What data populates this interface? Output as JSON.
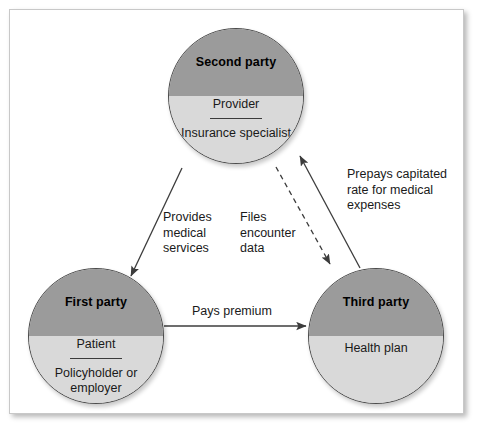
{
  "figure": {
    "type": "cycle-diagram"
  },
  "nodes": [
    {
      "id": "second-party",
      "title": "Second party",
      "role": "Provider",
      "sub": "Insurance\nspecialist",
      "position": "top-center"
    },
    {
      "id": "first-party",
      "title": "First party",
      "role": "Patient",
      "sub": "Policyholder\nor employer",
      "position": "bottom-left"
    },
    {
      "id": "third-party",
      "title": "Third party",
      "role": "",
      "sub": "Health plan",
      "position": "bottom-right"
    }
  ],
  "edges": [
    {
      "id": "provides-medical-services",
      "label": "Provides\nmedical\nservices",
      "from": "second-party",
      "to": "first-party",
      "style": "solid"
    },
    {
      "id": "files-encounter-data",
      "label": "Files\nencounter\ndata",
      "from": "second-party",
      "to": "third-party",
      "style": "dashed"
    },
    {
      "id": "prepays-capitated-rate",
      "label": "Prepays capitated\nrate for medical\nexpenses",
      "from": "third-party",
      "to": "second-party",
      "style": "solid"
    },
    {
      "id": "pays-premium",
      "label": "Pays premium",
      "from": "first-party",
      "to": "third-party",
      "style": "solid"
    }
  ],
  "colors": {
    "node_top_half": "#9b9b9b",
    "node_bottom_half": "#d9d9d9",
    "node_outline": "#4a4a4a",
    "frame_border": "#c8c8c8",
    "arrow": "#3c3c3c",
    "text": "#1a1a1a",
    "background": "#ffffff"
  }
}
